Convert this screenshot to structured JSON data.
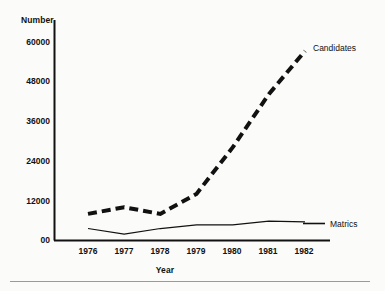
{
  "chart_data": {
    "type": "line",
    "title": "",
    "xlabel": "Year",
    "ylabel": "Number",
    "categories": [
      "1976",
      "1977",
      "1978",
      "1979",
      "1980",
      "1981",
      "1982"
    ],
    "x": [
      1976,
      1977,
      1978,
      1979,
      1980,
      1981,
      1982
    ],
    "xlim": [
      1976,
      1982
    ],
    "ylim": [
      0,
      60000
    ],
    "yticks": [
      "00",
      "12000",
      "24000",
      "36000",
      "48000",
      "60000"
    ],
    "ytick_values": [
      0,
      12000,
      24000,
      36000,
      48000,
      60000
    ],
    "grid": false,
    "legend_position": "right-inline",
    "series": [
      {
        "name": "Candidates",
        "style": "dashed",
        "color": "#111111",
        "width": 4,
        "values": [
          8000,
          10000,
          8000,
          14000,
          28000,
          44000,
          57000
        ]
      },
      {
        "name": "Matrics",
        "style": "solid",
        "color": "#111111",
        "width": 1.2,
        "values": [
          3600,
          1900,
          3600,
          4700,
          4700,
          5800,
          5600
        ]
      }
    ],
    "annotations": [
      {
        "text": "Candidates",
        "anchor": "end-of-series-1"
      },
      {
        "text": "Matrics",
        "anchor": "end-of-series-2"
      }
    ]
  },
  "axes": {
    "y_title": "Number",
    "x_title": "Year",
    "y_ticks": [
      {
        "label": "60000"
      },
      {
        "label": "48000"
      },
      {
        "label": "36000"
      },
      {
        "label": "24000"
      },
      {
        "label": "12000"
      },
      {
        "label": "00"
      }
    ],
    "x_ticks": [
      {
        "label": "1976"
      },
      {
        "label": "1977"
      },
      {
        "label": "1978"
      },
      {
        "label": "1979"
      },
      {
        "label": "1980"
      },
      {
        "label": "1981"
      },
      {
        "label": "1982"
      }
    ]
  },
  "series_labels": {
    "candidates": "Candidates",
    "matrics": "Matrics"
  },
  "colors": {
    "ink": "#111111",
    "background": "#fbfbfa",
    "rule": "#9a9a98"
  }
}
